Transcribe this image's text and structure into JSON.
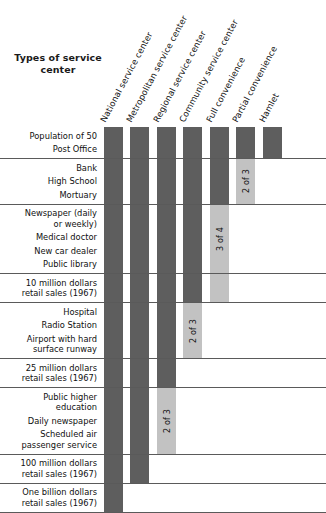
{
  "chart": {
    "title": "Types of\nservice center",
    "colors": {
      "bar_present": "#5e5e5e",
      "bar_partial": "#c2c2c2",
      "rule": "#5a5a5a",
      "background": "#ffffff",
      "text": "#111111"
    }
  },
  "chart_data": {
    "type": "heatmap",
    "title": "Types of service center",
    "xlabel": "",
    "ylabel": "",
    "grid": true,
    "legend": "none",
    "categories": [
      "National service center",
      "Metropolitan service center",
      "Regional service center",
      "Community service center",
      "Full convenience",
      "Partial convenience",
      "Hamlet"
    ],
    "rows": [
      {
        "group": 1,
        "labels": [
          "Population of 50",
          "Post Office"
        ],
        "cells": [
          "present",
          "present",
          "present",
          "present",
          "present",
          "present",
          "present"
        ],
        "notes": [
          "",
          "",
          "",
          "",
          "",
          "",
          ""
        ]
      },
      {
        "group": 2,
        "labels": [
          "Bank",
          "High School",
          "Mortuary"
        ],
        "cells": [
          "present",
          "present",
          "present",
          "present",
          "present",
          "partial",
          "absent"
        ],
        "notes": [
          "",
          "",
          "",
          "",
          "",
          "2 of 3",
          ""
        ]
      },
      {
        "group": 3,
        "labels": [
          "Newspaper (daily\nor weekly)",
          "Medical doctor",
          "New car dealer",
          "Public library"
        ],
        "cells": [
          "present",
          "present",
          "present",
          "present",
          "partial",
          "absent",
          "absent"
        ],
        "notes": [
          "",
          "",
          "",
          "",
          "3 of 4",
          "",
          ""
        ]
      },
      {
        "group": 4,
        "labels": [
          "10 million dollars\nretail sales (1967)"
        ],
        "cells": [
          "present",
          "present",
          "present",
          "present",
          "partial",
          "absent",
          "absent"
        ],
        "notes": [
          "",
          "",
          "",
          "",
          "",
          "",
          ""
        ]
      },
      {
        "group": 5,
        "labels": [
          "Hospital",
          "Radio Station",
          "Airport with hard\nsurface runway"
        ],
        "cells": [
          "present",
          "present",
          "present",
          "partial",
          "absent",
          "absent",
          "absent"
        ],
        "notes": [
          "",
          "",
          "",
          "2 of 3",
          "",
          "",
          ""
        ]
      },
      {
        "group": 6,
        "labels": [
          "25 million dollars\nretail sales (1967)"
        ],
        "cells": [
          "present",
          "present",
          "present",
          "absent",
          "absent",
          "absent",
          "absent"
        ],
        "notes": [
          "",
          "",
          "",
          "",
          "",
          "",
          ""
        ]
      },
      {
        "group": 7,
        "labels": [
          "Public higher\neducation",
          "Daily newspaper",
          "Scheduled air\npassenger service"
        ],
        "cells": [
          "present",
          "present",
          "partial",
          "absent",
          "absent",
          "absent",
          "absent"
        ],
        "notes": [
          "",
          "",
          "2 of 3",
          "",
          "",
          "",
          ""
        ]
      },
      {
        "group": 8,
        "labels": [
          "100 million dollars\nretail sales (1967)"
        ],
        "cells": [
          "present",
          "present",
          "absent",
          "absent",
          "absent",
          "absent",
          "absent"
        ],
        "notes": [
          "",
          "",
          "",
          "",
          "",
          "",
          ""
        ]
      },
      {
        "group": 9,
        "labels": [
          "One billion dollars\nretail sales (1967)"
        ],
        "cells": [
          "present",
          "absent",
          "absent",
          "absent",
          "absent",
          "absent",
          "absent"
        ],
        "notes": [
          "",
          "",
          "",
          "",
          "",
          "",
          ""
        ]
      }
    ]
  }
}
